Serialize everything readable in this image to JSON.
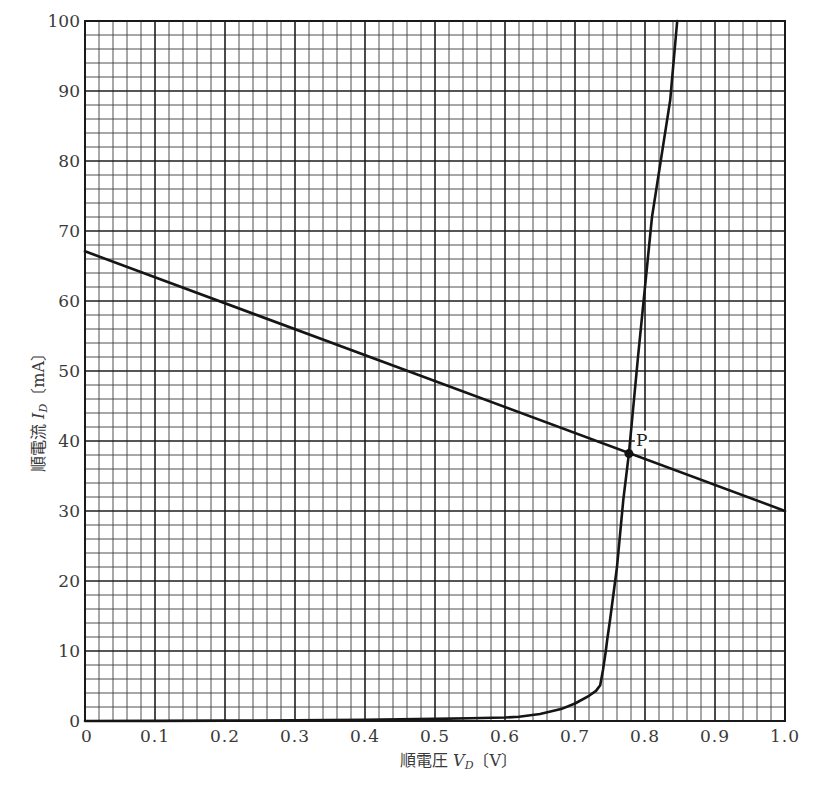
{
  "chart_data": {
    "type": "line",
    "title": "",
    "xlabel": "順電圧 V_D〔V〕",
    "ylabel": "順電流 I_D〔mA〕",
    "xlabel_parts": {
      "prefix": "順電圧 ",
      "var": "V",
      "sub": "D",
      "unit": "〔V〕"
    },
    "ylabel_parts": {
      "prefix": "順電流 ",
      "var": "I",
      "sub": "D",
      "unit": "〔mA〕"
    },
    "xlim": [
      0,
      1.0
    ],
    "ylim": [
      0,
      100
    ],
    "grid": true,
    "grid_major_x": 0.1,
    "grid_minor_x": 0.02,
    "grid_major_y": 10,
    "grid_minor_y": 2,
    "x_ticks": [
      "0",
      "0.1",
      "0.2",
      "0.3",
      "0.4",
      "0.5",
      "0.6",
      "0.7",
      "0.8",
      "0.9",
      "1.0"
    ],
    "y_ticks": [
      "0",
      "10",
      "20",
      "30",
      "40",
      "50",
      "60",
      "70",
      "80",
      "90",
      "100"
    ],
    "series": [
      {
        "name": "Diode characteristic",
        "x": [
          0,
          0.1,
          0.2,
          0.3,
          0.4,
          0.5,
          0.55,
          0.6,
          0.62,
          0.65,
          0.68,
          0.7,
          0.72,
          0.73,
          0.736,
          0.74,
          0.744,
          0.746,
          0.75,
          0.76,
          0.769,
          0.777,
          0.79,
          0.81,
          0.836,
          0.846
        ],
        "y": [
          0,
          0.02,
          0.05,
          0.1,
          0.18,
          0.3,
          0.4,
          0.5,
          0.6,
          1.0,
          1.7,
          2.5,
          3.6,
          4.3,
          5.1,
          7.3,
          10,
          11.6,
          14.4,
          22,
          31.6,
          38.2,
          52,
          72,
          88.7,
          100
        ]
      },
      {
        "name": "Load line",
        "x": [
          0,
          1.0
        ],
        "y": [
          67.1,
          30
        ]
      }
    ],
    "annotations": [
      {
        "label": "P",
        "x": 0.777,
        "y": 38.2,
        "type": "point"
      }
    ],
    "legend": "none"
  }
}
